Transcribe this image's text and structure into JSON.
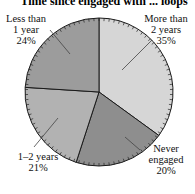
{
  "chart_data": {
    "type": "pie",
    "title": "Time since engaged with ... loops",
    "title_partially_visible": true,
    "start": "top",
    "direction": "clockwise",
    "slices": [
      {
        "label_lines": [
          "More than",
          "2 years"
        ],
        "label": "More than 2 years",
        "value": 35,
        "value_text": "35%",
        "color": "#d6d6d6"
      },
      {
        "label_lines": [
          "Never",
          "engaged"
        ],
        "label": "Never engaged",
        "value": 20,
        "value_text": "20%",
        "color": "#8e8e8e"
      },
      {
        "label_lines": [
          "1–2 years"
        ],
        "label": "1–2 years",
        "value": 21,
        "value_text": "21%",
        "color": "#b2b2b2"
      },
      {
        "label_lines": [
          "Less than",
          "1 year"
        ],
        "label": "Less than 1 year",
        "value": 24,
        "value_text": "24%",
        "color": "#9c9c9c"
      }
    ],
    "legend": "none",
    "units": "percent"
  }
}
